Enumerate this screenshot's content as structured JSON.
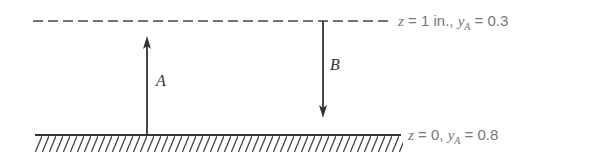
{
  "diagram": {
    "top_boundary": {
      "style": "dashed",
      "z_label": "z",
      "z_value": "= 1 in.,",
      "y_label": "y",
      "y_sub": "A",
      "y_value": "= 0.3"
    },
    "bottom_boundary": {
      "style": "solid-hatched",
      "z_label": "z",
      "z_value": "= 0,",
      "y_label": "y",
      "y_sub": "A",
      "y_value": "= 0.8"
    },
    "arrows": [
      {
        "label": "A",
        "direction": "up"
      },
      {
        "label": "B",
        "direction": "down"
      }
    ],
    "colors": {
      "line": "#333333",
      "text": "#777777"
    }
  }
}
